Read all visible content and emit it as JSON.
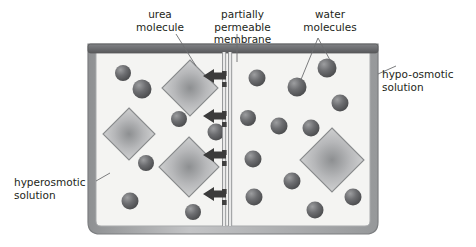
{
  "diagram": {
    "labels": {
      "urea_molecule": "urea\nmolecule",
      "partially_permeable_membrane": "partially permeable\nmembrane",
      "water_molecules": "water\nmolecules",
      "hypo_osmotic_solution": "hypo-osmotic\nsolution",
      "hyperosmotic_solution": "hyperosmotic\nsolution"
    },
    "colors": {
      "background": "#ffffff",
      "text": "#231f20",
      "leader_line": "#58595b",
      "container_wall": "#a7a9ac",
      "container_wall_edge": "#808285",
      "container_rim": "#6d6e71",
      "solution_fill": "#f4f4f2",
      "membrane_line": "#939598",
      "membrane_pore": "#3f3f3f",
      "arrow": "#3b3b3b",
      "molecule_dark": "#58595b",
      "molecule_light": "#9a9b9d",
      "diamond_edge": "#939598",
      "diamond_center": "#8d8f91",
      "diamond_fill": "#d8d9da"
    },
    "container": {
      "left": 88,
      "top": 44,
      "width": 290,
      "height": 190
    },
    "membrane": {
      "x": 227,
      "top": 47,
      "bottom": 228,
      "pore_count": 8
    },
    "arrows": {
      "direction": "left",
      "count": 4,
      "y_positions": [
        76,
        116,
        155,
        194
      ],
      "meaning": "net movement of water from hypo-osmotic to hyperosmotic solution"
    },
    "compartments": [
      {
        "name": "hyperosmotic-solution",
        "side": "left",
        "urea_molecule_count": 3,
        "water_molecule_count": 7
      },
      {
        "name": "hypo-osmotic-solution",
        "side": "right",
        "urea_molecule_count": 1,
        "water_molecule_count": 12
      }
    ],
    "urea_molecules": [
      {
        "cx": 190,
        "cy": 88,
        "r": 28,
        "side": "left"
      },
      {
        "cx": 129,
        "cy": 134,
        "r": 26,
        "side": "left"
      },
      {
        "cx": 189,
        "cy": 167,
        "r": 30,
        "side": "left"
      },
      {
        "cx": 332,
        "cy": 160,
        "r": 32,
        "side": "right"
      }
    ],
    "water_molecules": [
      {
        "cx": 123,
        "cy": 73,
        "r": 8,
        "side": "left"
      },
      {
        "cx": 142,
        "cy": 89,
        "r": 9.5,
        "side": "left"
      },
      {
        "cx": 179,
        "cy": 119,
        "r": 8,
        "side": "left"
      },
      {
        "cx": 216,
        "cy": 132,
        "r": 8.5,
        "side": "left"
      },
      {
        "cx": 146,
        "cy": 163,
        "r": 8,
        "side": "left"
      },
      {
        "cx": 130,
        "cy": 201,
        "r": 8.5,
        "side": "left"
      },
      {
        "cx": 193,
        "cy": 212,
        "r": 8,
        "side": "left"
      },
      {
        "cx": 257,
        "cy": 78,
        "r": 8.5,
        "side": "right"
      },
      {
        "cx": 297,
        "cy": 87,
        "r": 9.5,
        "side": "right"
      },
      {
        "cx": 327,
        "cy": 68,
        "r": 9.5,
        "side": "right"
      },
      {
        "cx": 340,
        "cy": 103,
        "r": 8.5,
        "side": "right"
      },
      {
        "cx": 279,
        "cy": 126,
        "r": 8.5,
        "side": "right"
      },
      {
        "cx": 311,
        "cy": 128,
        "r": 8.5,
        "side": "right"
      },
      {
        "cx": 253,
        "cy": 159,
        "r": 8.5,
        "side": "right"
      },
      {
        "cx": 292,
        "cy": 181,
        "r": 8.5,
        "side": "right"
      },
      {
        "cx": 254,
        "cy": 197,
        "r": 8.5,
        "side": "right"
      },
      {
        "cx": 353,
        "cy": 197,
        "r": 8.5,
        "side": "right"
      },
      {
        "cx": 315,
        "cy": 210,
        "r": 8.5,
        "side": "right"
      }
    ]
  }
}
